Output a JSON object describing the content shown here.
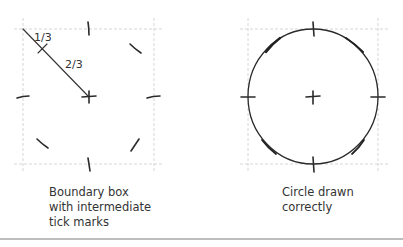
{
  "left_panel": {
    "title": "boundary-box-panel",
    "labels": {
      "one_third": "1/3",
      "two_thirds": "2/3"
    },
    "caption": [
      "Boundary box",
      "with intermediate",
      "tick marks"
    ]
  },
  "right_panel": {
    "title": "circle-panel",
    "caption": [
      "Circle drawn",
      "correctly"
    ]
  },
  "colors": {
    "ink": "#2a2a2a",
    "guide": "#d6d6d6",
    "rule": "#bdbdbd",
    "text": "#333333"
  }
}
